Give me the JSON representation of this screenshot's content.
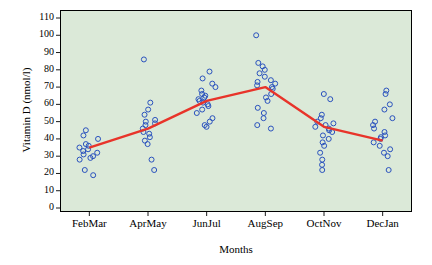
{
  "chart_data": {
    "type": "scatter",
    "title": "",
    "xlabel": "Months",
    "ylabel": "Vitamin D (nmol/l)",
    "ylim": [
      0,
      110
    ],
    "yticks": [
      0,
      10,
      20,
      30,
      40,
      50,
      60,
      70,
      80,
      90,
      100,
      110
    ],
    "grid": false,
    "legend": null,
    "categories": [
      "FebMar",
      "AprMay",
      "JunJul",
      "AugSep",
      "OctNov",
      "DecJan"
    ],
    "series": [
      {
        "name": "Mean Vitamin D",
        "type": "line",
        "color": "#e8342a",
        "values": [
          35,
          46,
          62,
          70,
          47,
          39
        ]
      }
    ],
    "points": {
      "color": "#2a52be",
      "marker": "open-circle",
      "groups": [
        {
          "category": "FebMar",
          "values": [
            45,
            42,
            40,
            37,
            36,
            35,
            34,
            33,
            32,
            31,
            30,
            29,
            28,
            22,
            19
          ]
        },
        {
          "category": "AprMay",
          "values": [
            86,
            61,
            57,
            54,
            51,
            50,
            49,
            48,
            46,
            44,
            43,
            41,
            39,
            37,
            28,
            22
          ]
        },
        {
          "category": "JunJul",
          "values": [
            79,
            75,
            72,
            70,
            68,
            66,
            65,
            64,
            63,
            62,
            61,
            60,
            59,
            57,
            55,
            52,
            50,
            48,
            47
          ]
        },
        {
          "category": "AugSep",
          "values": [
            100,
            84,
            82,
            80,
            78,
            76,
            74,
            73,
            72,
            71,
            70,
            69,
            66,
            64,
            62,
            58,
            55,
            52,
            48,
            46
          ]
        },
        {
          "category": "OctNov",
          "values": [
            66,
            63,
            54,
            52,
            50,
            49,
            48,
            47,
            46,
            45,
            44,
            42,
            40,
            38,
            36,
            32,
            28,
            25,
            22
          ]
        },
        {
          "category": "DecJan",
          "values": [
            68,
            66,
            60,
            57,
            52,
            50,
            48,
            46,
            44,
            42,
            41,
            40,
            38,
            36,
            34,
            32,
            30,
            22
          ]
        }
      ]
    }
  }
}
